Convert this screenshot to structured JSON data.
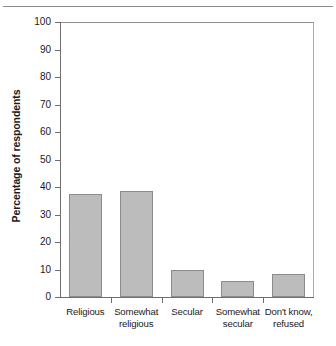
{
  "chart_data": {
    "type": "bar",
    "title": "",
    "xlabel": "",
    "ylabel": "Percentage of respondents",
    "ylim": [
      0,
      100
    ],
    "ytick_step": 10,
    "grid": false,
    "legend": "none",
    "bar_fill_color": "#bcbcbc",
    "bar_edge_color": "#8c8c8c",
    "axis_color": "#6e6e6e",
    "categories": [
      "Religious",
      "Somewhat religious",
      "Secular",
      "Somewhat secular",
      "Don't know, refused"
    ],
    "category_lines": [
      [
        "Religious"
      ],
      [
        "Somewhat",
        "religious"
      ],
      [
        "Secular"
      ],
      [
        "Somewhat",
        "secular"
      ],
      [
        "Don't know,",
        "refused"
      ]
    ],
    "values": [
      37.5,
      38.5,
      10,
      6,
      8.5
    ],
    "ytick_labels": [
      "0",
      "10",
      "20",
      "30",
      "40",
      "50",
      "60",
      "70",
      "80",
      "90",
      "100"
    ]
  }
}
